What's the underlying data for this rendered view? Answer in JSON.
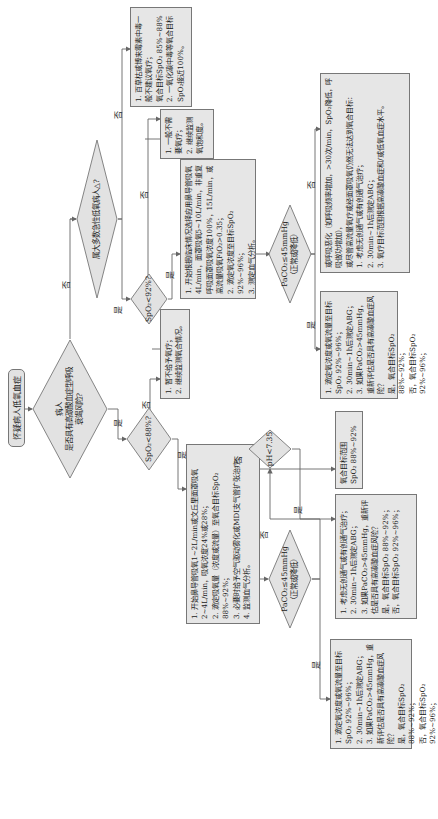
{
  "start": {
    "label": "怀疑病人低氧血症"
  },
  "decisions": {
    "co2_risk": {
      "lines": [
        "病人",
        "是否具有高碳酸血症型呼吸",
        "衰竭风险?"
      ]
    },
    "spo2_88": {
      "lines": [
        "SpO₂<88%?"
      ]
    },
    "acute_hypoxia": {
      "lines": [
        "属大多数急性低氧病人△?"
      ]
    },
    "spo2_92": {
      "lines": [
        "SpO₂<92%?"
      ]
    },
    "paco2_left": {
      "lines": [
        "PaCO₂≤45mmHg",
        "（正常或降低）"
      ]
    },
    "paco2_right": {
      "lines": [
        "PaCO₂≤45mmHg",
        "（正常或降低）"
      ]
    },
    "ph": {
      "lines": [
        "pH<7.35"
      ]
    }
  },
  "branch_labels": {
    "yes": "是",
    "no": "否"
  },
  "boxes": {
    "co_poisoning": {
      "lines": [
        "1. 百草枯或博来霉素中毒一般不建议氧疗；",
        "氧合目标SpO₂ 85%~88%",
        "2. 一氧化碳中毒等氧合目标SpO₂接近100%。"
      ]
    },
    "no_oxygen_needed": {
      "lines": [
        "1. 一般不需要氧疗；",
        "2. 继续监测氧饱和度。"
      ]
    },
    "hold_oxygen": {
      "lines": [
        "1. 暂不给予氧疗；",
        "2. 继续监测氧合情况。"
      ]
    },
    "high_flow_start": {
      "lines": [
        "1. 开始根据临床情况选择应用鼻导管吸氧4L/min，面罩吸氧5~10L/min，非重复呼吸面罩吸氧浓度100%，15L/min，或高流量吸氧FiO₂>0.35；",
        "2. 滴定氧浓度至目标SpO₂ 92%~96%；",
        "3. 测定血气分析。"
      ]
    },
    "low_flow_start": {
      "lines": [
        "1. 开始鼻导管吸氧1~2L/min或文丘里面罩吸氧2~4L/min，吸氧浓度24%或28%；",
        "2. 滴定吸氧量（浓度或流量）至氧合目标SpO₂ 88%~92%；",
        "3. 必要时给予空气驱动雾化或MDI支气管扩张治疗；",
        "4. 监测血气分析。"
      ]
    },
    "right_paco2_yes": {
      "lines": [
        "1. 滴定氧浓度或氧流量至目标SpO₂ 92%~96%；",
        "2. 30min~1h后测定ABG；",
        "3. 如果PaCO₂>45mmHg，重新评估是否具有高碳酸血症风险？",
        "是，氧合目标SpO₂ 88%~92%；",
        "否，氧合目标SpO₂ 92%~96%；"
      ]
    },
    "right_paco2_no": {
      "lines": [
        "或呼吸恶化（如呼吸频率增加，>30次/min，SpO₂降低，呼吸做功增加），",
        "或尽管高流量氧疗或经面罩吸氧仍然无法达到氧合目标：",
        "1. 考虑无创通气或有创通气治疗；",
        "2. 30min~1h后测定ABG；",
        "3. 氧疗目标范围根据高碳酸血症和/或低氧血症水平。"
      ]
    },
    "left_paco2_yes": {
      "lines": [
        "1. 滴定氧浓度或氧流量至目标SpO₂ 92%~96%；",
        "2. 30min~1h后测定ABG；",
        "3. 如果PaCO₂>45mmHg，重新评估是否具有高碳酸血症风险？",
        "是，氧合目标SpO₂ 88%~92%；",
        "否，氧合目标SpO₂ 92%~96%；"
      ]
    },
    "ph_yes": {
      "lines": [
        "1. 考虑无创通气或有创通气治疗；",
        "2. 30min~1h后测定ABG；",
        "3. 如果PaCO₂>45mmHg，重新评估是否具有高碳酸血症风险？",
        "是，氧合目标SpO₂ 88%~92%；",
        "否，氧合目标SpO₂ 92%~96%；"
      ]
    },
    "ph_no": {
      "lines": [
        "氧合目标范围",
        "SpO₂ 88%~92%"
      ]
    }
  },
  "colors": {
    "box_fill": "#e6e6e6",
    "border": "#777777",
    "line": "#666666"
  }
}
